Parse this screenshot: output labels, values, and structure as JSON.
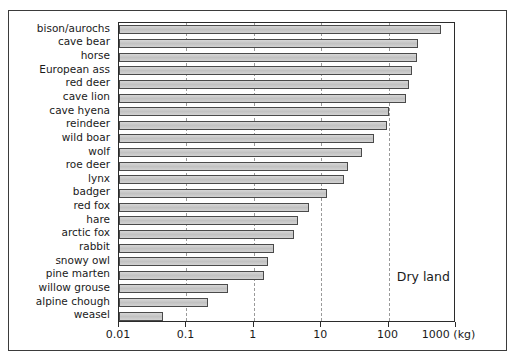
{
  "chart_data": {
    "type": "bar",
    "orientation": "horizontal",
    "title": "",
    "subtitle": "",
    "xlabel": "",
    "ylabel": "",
    "xscale": "log",
    "xlim": [
      0.01,
      1000
    ],
    "grid": true,
    "legend": null,
    "annotations": [
      {
        "text": "Dry land",
        "x_value": 300,
        "y_category": "pine marten"
      }
    ],
    "xticks": [
      {
        "value": 0.01,
        "label": "0.01"
      },
      {
        "value": 0.1,
        "label": "0.1"
      },
      {
        "value": 1,
        "label": "1"
      },
      {
        "value": 10,
        "label": "10"
      },
      {
        "value": 100,
        "label": "100"
      },
      {
        "value": 1000,
        "label": "1000 (kg)"
      }
    ],
    "unit": "kg",
    "categories": [
      "bison/aurochs",
      "cave bear",
      "horse",
      "European ass",
      "red deer",
      "cave lion",
      "cave hyena",
      "reindeer",
      "wild boar",
      "wolf",
      "roe deer",
      "lynx",
      "badger",
      "red fox",
      "hare",
      "arctic fox",
      "rabbit",
      "snowy owl",
      "pine marten",
      "willow grouse",
      "alpine chough"
    ],
    "values": [
      600,
      270,
      260,
      220,
      200,
      180,
      100,
      95,
      60,
      40,
      25,
      22,
      12,
      6.5,
      4.5,
      4.0,
      2.0,
      1.6,
      1.4,
      0.42,
      0.21
    ],
    "extra_categories": [
      "weasel"
    ],
    "extra_values": [
      0.045
    ],
    "all_bars": [
      {
        "label": "bison/aurochs",
        "value": 600
      },
      {
        "label": "cave bear",
        "value": 270
      },
      {
        "label": "horse",
        "value": 260
      },
      {
        "label": "European ass",
        "value": 220
      },
      {
        "label": "red deer",
        "value": 200
      },
      {
        "label": "cave lion",
        "value": 180
      },
      {
        "label": "cave hyena",
        "value": 100
      },
      {
        "label": "reindeer",
        "value": 95
      },
      {
        "label": "wild boar",
        "value": 60
      },
      {
        "label": "wolf",
        "value": 40
      },
      {
        "label": "roe deer",
        "value": 25
      },
      {
        "label": "lynx",
        "value": 22
      },
      {
        "label": "badger",
        "value": 12
      },
      {
        "label": "red fox",
        "value": 6.5
      },
      {
        "label": "hare",
        "value": 4.5
      },
      {
        "label": "arctic fox",
        "value": 4.0
      },
      {
        "label": "rabbit",
        "value": 2.0
      },
      {
        "label": "snowy owl",
        "value": 1.6
      },
      {
        "label": "pine marten",
        "value": 1.4
      },
      {
        "label": "willow grouse",
        "value": 0.42
      },
      {
        "label": "alpine chough",
        "value": 0.21
      },
      {
        "label": "weasel",
        "value": 0.045
      }
    ],
    "colors": {
      "bar_fill": "#c9c9c9",
      "bar_stroke": "#4a4a4a",
      "grid": "#9a9a9a",
      "axis": "#2b2b2b",
      "text": "#1a1a1a",
      "background": "#ffffff",
      "frame": "#3b3b3b"
    }
  }
}
